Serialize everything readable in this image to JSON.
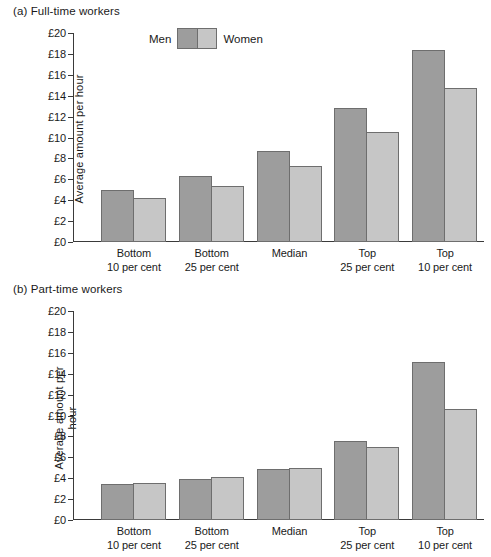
{
  "figure": {
    "panels": [
      {
        "id": "a",
        "title": "(a) Full-time workers",
        "ylabel": "Average amount per hour"
      },
      {
        "id": "b",
        "title": "(b) Part-time workers",
        "ylabel": "Average amount per hour"
      }
    ],
    "legend": {
      "men_label": "Men",
      "women_label": "Women",
      "men_color": "#9d9d9d",
      "women_color": "#c6c6c6",
      "border_color": "#6e6e6e"
    },
    "yticks": [
      "£20",
      "£18",
      "£16",
      "£14",
      "£12",
      "£10",
      "£8",
      "£6",
      "£4",
      "£2",
      "£0"
    ],
    "categories": [
      "Bottom\n10 per cent",
      "Bottom\n25 per cent",
      "Median",
      "Top\n25 per cent",
      "Top\n10 per cent"
    ]
  },
  "chart_data": [
    {
      "type": "bar",
      "title": "(a) Full-time workers",
      "xlabel": "",
      "ylabel": "Average amount per hour",
      "ylim": [
        0,
        20
      ],
      "ytick_step": 2,
      "currency": "£",
      "grid": false,
      "legend_position": "top-left-inside",
      "categories": [
        "Bottom 10 per cent",
        "Bottom 25 per cent",
        "Median",
        "Top 25 per cent",
        "Top 10 per cent"
      ],
      "series": [
        {
          "name": "Men",
          "color": "#9d9d9d",
          "values": [
            4.95,
            6.3,
            8.75,
            12.8,
            18.4
          ]
        },
        {
          "name": "Women",
          "color": "#c6c6c6",
          "values": [
            4.2,
            5.4,
            7.3,
            10.5,
            14.7
          ]
        }
      ]
    },
    {
      "type": "bar",
      "title": "(b) Part-time workers",
      "xlabel": "",
      "ylabel": "Average amount per hour",
      "ylim": [
        0,
        20
      ],
      "ytick_step": 2,
      "currency": "£",
      "grid": false,
      "legend_position": "none",
      "categories": [
        "Bottom 10 per cent",
        "Bottom 25 per cent",
        "Median",
        "Top 25 per cent",
        "Top 10 per cent"
      ],
      "series": [
        {
          "name": "Men",
          "color": "#9d9d9d",
          "values": [
            3.45,
            3.9,
            4.9,
            7.6,
            15.15
          ]
        },
        {
          "name": "Women",
          "color": "#c6c6c6",
          "values": [
            3.55,
            4.15,
            5.0,
            6.95,
            10.6
          ]
        }
      ]
    }
  ]
}
